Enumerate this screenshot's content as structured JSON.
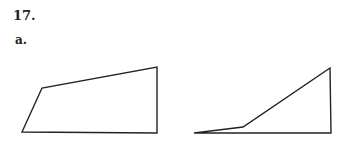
{
  "problem": {
    "number": "17.",
    "part": "a."
  },
  "figures": [
    {
      "name": "quadrilateral-left",
      "points": "22,132 42,88 157,67 157,133",
      "stroke": "#222222"
    },
    {
      "name": "quadrilateral-right",
      "points": "194,133 243,127 330,68 331,133",
      "stroke": "#222222"
    }
  ]
}
